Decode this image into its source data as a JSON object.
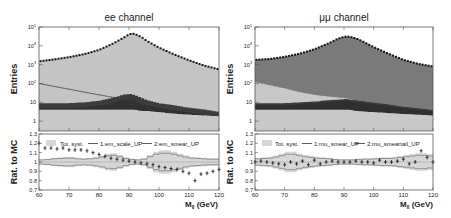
{
  "colors": {
    "signal_ee": "#c4c4c4",
    "signal_mumu": "#7a7a7a",
    "bkg_light": "#c8c8c8",
    "bkg_mid": "#6a6a6a",
    "bkg_dark": "#3c3c3c",
    "bkg_darkest": "#2a2a2a",
    "band": "#d6d6d6",
    "syst_line": "#777777",
    "data": "#111111",
    "frame": "#555555"
  },
  "chart_data": [
    {
      "type": "area",
      "panel": "upper",
      "title": "ee channel",
      "xlabel": "M_ll (GeV)",
      "ylabel": "Entries",
      "yscale": "log",
      "ylim": [
        0.3,
        100000
      ],
      "xlim": [
        60,
        120
      ],
      "ytick_labels": [
        "1",
        "10",
        "10^2",
        "10^3",
        "10^4",
        "10^5"
      ],
      "x": [
        60,
        65,
        70,
        75,
        80,
        85,
        88,
        90,
        91,
        92,
        94,
        96,
        100,
        105,
        110,
        115,
        120
      ],
      "series": [
        {
          "name": "Data",
          "style": "points",
          "values": [
            1500,
            1900,
            2500,
            3600,
            6000,
            14000,
            26000,
            40000,
            45000,
            42000,
            30000,
            18000,
            8000,
            3500,
            1700,
            900,
            560
          ]
        },
        {
          "name": "Z signal (MC)",
          "style": "filled",
          "values": [
            1500,
            1900,
            2500,
            3600,
            6000,
            14000,
            26000,
            40000,
            45000,
            42000,
            30000,
            18000,
            8000,
            3500,
            1700,
            900,
            560
          ]
        },
        {
          "name": "Background outline",
          "style": "line",
          "values": [
            100,
            70,
            50,
            35,
            25,
            18,
            15,
            13,
            12,
            11,
            9,
            8,
            6,
            5,
            5,
            4,
            3
          ]
        },
        {
          "name": "Background 2",
          "style": "filled",
          "values": [
            9,
            9,
            9,
            10,
            12,
            18,
            25,
            28,
            27,
            24,
            18,
            13,
            9,
            7,
            5,
            4,
            3
          ]
        },
        {
          "name": "Background 3",
          "style": "filled",
          "values": [
            4,
            4,
            4,
            4,
            4,
            4,
            4,
            4,
            4,
            4,
            3.5,
            3.5,
            3,
            2.5,
            2.2,
            2,
            1.8
          ]
        }
      ]
    },
    {
      "type": "scatter",
      "panel": "ratio",
      "title": "ee channel",
      "xlabel": "M_ll (GeV)",
      "ylabel": "Rat. to MC",
      "ylim": [
        0.7,
        1.3
      ],
      "xlim": [
        60,
        120
      ],
      "ytick_labels": [
        "0.7",
        "0.8",
        "0.9",
        "1",
        "1.1",
        "1.2",
        "1.3"
      ],
      "xtick_labels": [
        "60",
        "70",
        "80",
        "90",
        "100",
        "110",
        "120"
      ],
      "legend": [
        "Tot. syst.",
        "1:em_scale_UP",
        "2:em_smear_UP"
      ],
      "x": [
        60,
        62,
        64,
        66,
        68,
        70,
        72,
        74,
        76,
        78,
        80,
        82,
        84,
        86,
        88,
        90,
        92,
        94,
        96,
        98,
        100,
        102,
        104,
        106,
        108,
        110,
        112,
        114,
        116,
        118,
        120
      ],
      "series": [
        {
          "name": "Data/MC",
          "values": [
            1.2,
            1.15,
            1.15,
            1.14,
            1.15,
            1.13,
            1.13,
            1.13,
            1.12,
            1.1,
            1.08,
            1.06,
            1.04,
            1.03,
            1.02,
            1.01,
            1.0,
            0.99,
            0.98,
            0.97,
            0.95,
            0.94,
            0.93,
            0.92,
            0.9,
            0.88,
            0.8,
            0.87,
            0.88,
            0.9,
            0.92
          ]
        },
        {
          "name": "Tot. syst. half-width",
          "values": [
            0.03,
            0.03,
            0.04,
            0.05,
            0.05,
            0.06,
            0.05,
            0.04,
            0.04,
            0.05,
            0.06,
            0.08,
            0.1,
            0.09,
            0.06,
            0.04,
            0.03,
            0.03,
            0.05,
            0.1,
            0.12,
            0.13,
            0.12,
            0.1,
            0.08,
            0.06,
            0.05,
            0.05,
            0.04,
            0.04,
            0.04
          ]
        }
      ]
    },
    {
      "type": "area",
      "panel": "upper",
      "title": "μμ channel",
      "xlabel": "M_ll (GeV)",
      "ylabel": "Entries",
      "yscale": "log",
      "ylim": [
        0.3,
        100000
      ],
      "xlim": [
        60,
        120
      ],
      "ytick_labels": [
        "1",
        "10",
        "10^2",
        "10^3",
        "10^4",
        "10^5"
      ],
      "x": [
        60,
        65,
        70,
        75,
        80,
        85,
        88,
        90,
        91,
        92,
        94,
        96,
        100,
        105,
        110,
        115,
        120
      ],
      "series": [
        {
          "name": "Data",
          "style": "points",
          "values": [
            1800,
            2000,
            2600,
            3800,
            6500,
            14000,
            24000,
            30000,
            31000,
            30000,
            25000,
            18000,
            8500,
            3800,
            1800,
            1100,
            800
          ]
        },
        {
          "name": "Z signal (MC)",
          "style": "filled",
          "values": [
            1800,
            2000,
            2600,
            3800,
            6500,
            14000,
            24000,
            30000,
            31000,
            30000,
            25000,
            18000,
            8500,
            3800,
            1800,
            1100,
            800
          ]
        },
        {
          "name": "Background 1",
          "style": "filled",
          "values": [
            120,
            80,
            55,
            35,
            25,
            20,
            18,
            17,
            16,
            15,
            13,
            12,
            10,
            8,
            6,
            5,
            4
          ]
        },
        {
          "name": "Background 2",
          "style": "filled",
          "values": [
            9,
            9,
            9,
            10,
            11,
            13,
            14,
            15,
            15,
            14,
            13,
            12,
            10,
            8,
            6,
            5,
            4
          ]
        },
        {
          "name": "Background 3",
          "style": "filled",
          "values": [
            4,
            4,
            4,
            4,
            4,
            4,
            4,
            4,
            4,
            4,
            3.5,
            3.3,
            3,
            2.7,
            2.4,
            2.2,
            2
          ]
        }
      ]
    },
    {
      "type": "scatter",
      "panel": "ratio",
      "title": "μμ channel",
      "xlabel": "M_ll (GeV)",
      "ylabel": "Rat. to MC",
      "ylim": [
        0.7,
        1.3
      ],
      "xlim": [
        60,
        120
      ],
      "ytick_labels": [
        "0.7",
        "0.8",
        "0.9",
        "1",
        "1.1",
        "1.2",
        "1.3"
      ],
      "xtick_labels": [
        "60",
        "70",
        "80",
        "90",
        "100",
        "110",
        "120"
      ],
      "legend": [
        "Tot. syst.",
        "1:mu_smear_UP",
        "2:mu_smeartail_UP"
      ],
      "x": [
        60,
        62,
        64,
        66,
        68,
        70,
        72,
        74,
        76,
        78,
        80,
        82,
        84,
        86,
        88,
        90,
        92,
        94,
        96,
        98,
        100,
        102,
        104,
        106,
        108,
        110,
        112,
        114,
        116,
        118,
        120
      ],
      "series": [
        {
          "name": "Data/MC",
          "values": [
            1.0,
            1.01,
            1.0,
            0.99,
            0.98,
            0.97,
            1.0,
            0.98,
            1.01,
            0.97,
            1.02,
            0.98,
            1.0,
            1.01,
            1.0,
            1.0,
            1.0,
            1.01,
            1.0,
            1.0,
            0.99,
            1.02,
            1.0,
            1.0,
            1.01,
            1.03,
            0.98,
            1.0,
            1.12,
            1.05,
            1.0
          ]
        },
        {
          "name": "Tot. syst. half-width",
          "values": [
            0.04,
            0.05,
            0.05,
            0.06,
            0.08,
            0.1,
            0.12,
            0.1,
            0.08,
            0.07,
            0.06,
            0.05,
            0.05,
            0.04,
            0.03,
            0.03,
            0.03,
            0.03,
            0.04,
            0.04,
            0.04,
            0.05,
            0.05,
            0.05,
            0.06,
            0.07,
            0.08,
            0.09,
            0.1,
            0.09,
            0.08
          ]
        }
      ]
    }
  ],
  "panels": {
    "left": {
      "title": "ee channel",
      "upper_ylabel": "Entries",
      "ratio_ylabel": "Rat. to MC",
      "xlabel_main": "M",
      "xlabel_sub": "ll",
      "xlabel_unit": " (GeV)",
      "legend": {
        "syst": "Tot. syst.",
        "var1": "1:em_scale_UP",
        "var2": "2:em_smear_UP"
      }
    },
    "right": {
      "title": "μμ channel",
      "upper_ylabel": "Entries",
      "ratio_ylabel": "Rat. to MC",
      "xlabel_main": "M",
      "xlabel_sub": "ll",
      "xlabel_unit": " (GeV)",
      "legend": {
        "syst": "Tot. syst.",
        "var1": "1:mu_smear_UP",
        "var2": "2:mu_smeartail_UP"
      }
    }
  },
  "ticks": {
    "upper_y": [
      {
        "label": "10",
        "sup": "5"
      },
      {
        "label": "10",
        "sup": "4"
      },
      {
        "label": "10",
        "sup": "3"
      },
      {
        "label": "10",
        "sup": "2"
      },
      {
        "label": "10",
        "sup": ""
      },
      {
        "label": "1",
        "sup": ""
      }
    ],
    "ratio_y": [
      "1.3",
      "1.2",
      "1.1",
      "1",
      "0.9",
      "0.8",
      "0.7"
    ],
    "x": [
      "60",
      "70",
      "80",
      "90",
      "100",
      "110",
      "120"
    ]
  }
}
